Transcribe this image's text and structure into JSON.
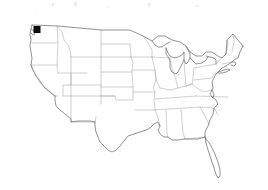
{
  "figure": {
    "kind": "choropleth-point-map",
    "region_label": "Contiguous United States",
    "background_color": "#ffffff",
    "outline_color": "#6e6e74",
    "state_border_color": "#a9a9b0",
    "marker_color": "#0b0b0b",
    "artifact_color": "#d8d8dc",
    "caption_text": ""
  },
  "markers": [
    {
      "name": "washington-state-marker",
      "label": "",
      "shape": "square",
      "color": "#0b0b0b",
      "x": 37,
      "y": 29.5,
      "size": 7
    }
  ],
  "artifacts": [
    {
      "x": 52,
      "y": 3,
      "w": 2,
      "h": 3
    },
    {
      "x": 74,
      "y": 2,
      "w": 2,
      "h": 4
    },
    {
      "x": 76,
      "y": 3,
      "w": 1,
      "h": 3
    },
    {
      "x": 148,
      "y": 3,
      "w": 2,
      "h": 3
    },
    {
      "x": 150,
      "y": 4,
      "w": 1,
      "h": 2
    },
    {
      "x": 196,
      "y": 5,
      "w": 2,
      "h": 2
    },
    {
      "x": 108,
      "y": 7,
      "w": 1,
      "h": 1
    },
    {
      "x": 36,
      "y": 9,
      "w": 1,
      "h": 1
    }
  ]
}
